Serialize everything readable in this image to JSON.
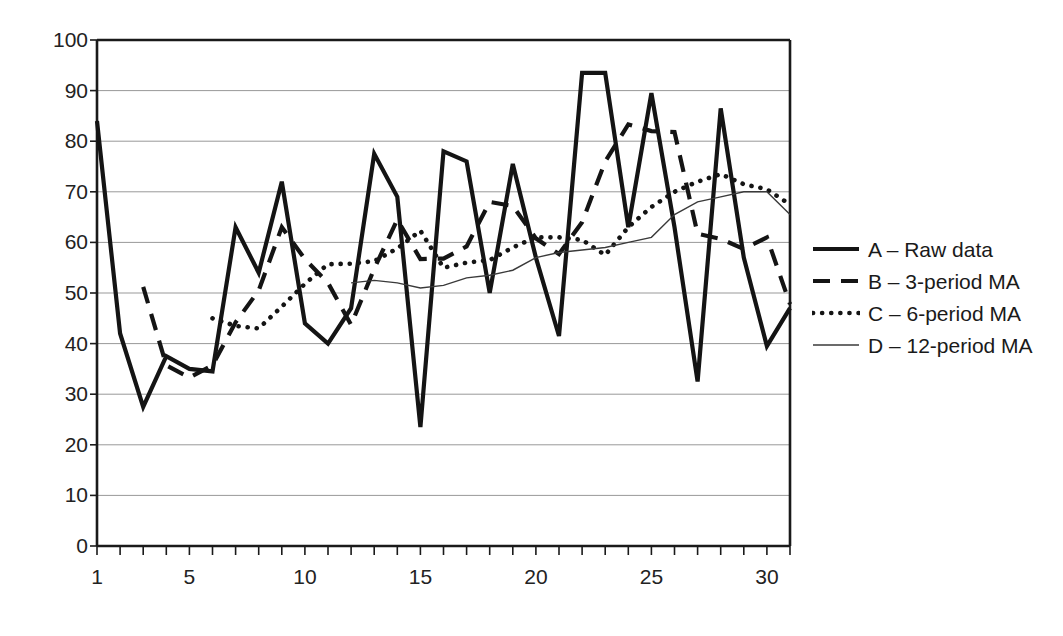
{
  "chart_data": {
    "type": "line",
    "title": "",
    "xlabel": "",
    "ylabel": "",
    "xlim": [
      1,
      31
    ],
    "ylim": [
      0,
      100
    ],
    "grid": "horizontal",
    "legend_position": "right",
    "x": [
      1,
      2,
      3,
      4,
      5,
      6,
      7,
      8,
      9,
      10,
      11,
      12,
      13,
      14,
      15,
      16,
      17,
      18,
      19,
      20,
      21,
      22,
      23,
      24,
      25,
      26,
      27,
      28,
      29,
      30,
      31
    ],
    "yticks": [
      0,
      10,
      20,
      30,
      40,
      50,
      60,
      70,
      80,
      90,
      100
    ],
    "xticks_labeled": [
      1,
      5,
      10,
      15,
      20,
      25,
      30
    ],
    "series": [
      {
        "name": "A – Raw data",
        "key": "A",
        "style": "solid-thick",
        "color": "#141414",
        "width": 4.2,
        "start_index": 1,
        "values": [
          84,
          42,
          27.5,
          37.5,
          35,
          34.5,
          63,
          54,
          72,
          44,
          40,
          47,
          77.5,
          69,
          23.5,
          78,
          76,
          50,
          75.5,
          57,
          41.5,
          93.5,
          93.5,
          63,
          89.5,
          63,
          32.5,
          86.5,
          57,
          39.5,
          47
        ]
      },
      {
        "name": "B – 3-period MA",
        "key": "B",
        "style": "dashed",
        "color": "#141414",
        "width": 4.2,
        "start_index": 3,
        "values": [
          null,
          null,
          51.2,
          35.7,
          33.3,
          35.7,
          44.2,
          50.5,
          63,
          56.7,
          52,
          43.7,
          54.8,
          64.5,
          56.7,
          56.8,
          59.2,
          68,
          67.2,
          60.8,
          57.7,
          64,
          76,
          83.3,
          82,
          81.8,
          61.7,
          60.7,
          58.7,
          61,
          47.8
        ]
      },
      {
        "name": "C – 6-period MA",
        "key": "C",
        "style": "dotted",
        "color": "#141414",
        "width": 4.6,
        "start_index": 6,
        "values": [
          null,
          null,
          null,
          null,
          null,
          45,
          43.5,
          43,
          47.3,
          51.8,
          55.7,
          55.8,
          56.3,
          58.8,
          62.3,
          55,
          56,
          56.5,
          59,
          61,
          61,
          60.5,
          57.5,
          63,
          67,
          70,
          72,
          73.5,
          71.5,
          70.5,
          67.5
        ]
      },
      {
        "name": "D – 12-period MA",
        "key": "D",
        "style": "solid-thin",
        "color": "#3a3a3a",
        "width": 1.4,
        "start_index": 12,
        "values": [
          null,
          null,
          null,
          null,
          null,
          null,
          null,
          null,
          null,
          null,
          null,
          52,
          52.5,
          52,
          51,
          51.5,
          53,
          53.5,
          54.5,
          57,
          58,
          58.5,
          59,
          60,
          61,
          65.5,
          68,
          69,
          70,
          70,
          65.5
        ]
      }
    ]
  },
  "axis": {
    "y_labels": [
      "100",
      "90",
      "80",
      "70",
      "60",
      "50",
      "40",
      "30",
      "20",
      "10",
      "0"
    ],
    "x_labels": [
      "1",
      "5",
      "10",
      "15",
      "20",
      "25",
      "30"
    ]
  },
  "legend": {
    "items": [
      {
        "label": "A – Raw data",
        "swatch": "solid-thick-swatch-icon"
      },
      {
        "label": "B – 3-period MA",
        "swatch": "dashed-swatch-icon"
      },
      {
        "label": "C – 6-period MA",
        "swatch": "dotted-swatch-icon"
      },
      {
        "label": "D – 12-period MA",
        "swatch": "solid-thin-swatch-icon"
      }
    ]
  },
  "colors": {
    "line": "#141414",
    "thin_line": "#3a3a3a",
    "grid": "#999999",
    "axis": "#1a1a1a",
    "background": "#ffffff"
  }
}
